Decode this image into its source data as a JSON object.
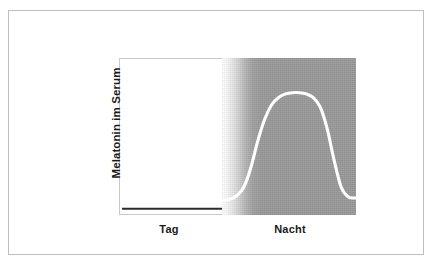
{
  "figure": {
    "ylabel": "Melatonin im Serum",
    "xlabels": [
      "Tag",
      "Nacht"
    ],
    "frame_color": "#bdbdbd",
    "day_panel_color": "#ffffff",
    "night_panel_color": "#9b9b9b",
    "day_line_color": "#2b2b2b",
    "night_curve_color": "#ffffff"
  },
  "chart_data": {
    "type": "line",
    "title": "",
    "subtitle": "",
    "xlabel": "",
    "ylabel": "Melatonin im Serum",
    "grid": false,
    "legend": "none",
    "annotations": [
      "Tag",
      "Nacht"
    ],
    "x_categories": [
      "Tag",
      "Nacht"
    ],
    "xlim": [
      0,
      100
    ],
    "ylim": [
      0,
      100
    ],
    "axis_ticks": {
      "x": [],
      "y": []
    },
    "series": [
      {
        "name": "Tag",
        "phase": "Tag",
        "color": "#2b2b2b",
        "x": [
          0,
          5,
          10,
          15,
          20,
          25,
          30,
          35,
          40,
          43
        ],
        "values": [
          3,
          3,
          3,
          3,
          3,
          3,
          3,
          3,
          3,
          3
        ]
      },
      {
        "name": "Nacht",
        "phase": "Nacht",
        "color": "#ffffff",
        "x": [
          43,
          46,
          49,
          52,
          55,
          58,
          61,
          64,
          67,
          70,
          73,
          76,
          79,
          82,
          85,
          88,
          91,
          94,
          97,
          100
        ],
        "values": [
          3,
          4,
          7,
          14,
          30,
          52,
          70,
          82,
          88,
          91,
          92,
          92,
          91,
          88,
          80,
          62,
          36,
          14,
          6,
          5
        ]
      }
    ]
  }
}
